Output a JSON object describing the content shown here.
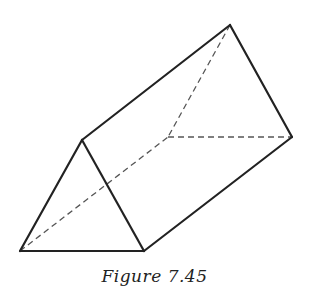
{
  "figure": {
    "caption": "Figure 7.45",
    "colors": {
      "edge": "#222222",
      "hidden_edge": "#555555",
      "background": "#ffffff"
    },
    "vertices": {
      "front_apex": [
        82,
        140
      ],
      "front_bottom_left": [
        20,
        251
      ],
      "front_bottom_right": [
        144,
        251
      ],
      "back_apex": [
        230,
        25
      ],
      "back_bottom_left_hidden": [
        168,
        137
      ],
      "back_bottom_right": [
        292,
        137
      ]
    },
    "visible_edges": [
      [
        "front_apex",
        "front_bottom_left"
      ],
      [
        "front_apex",
        "front_bottom_right"
      ],
      [
        "front_bottom_left",
        "front_bottom_right"
      ],
      [
        "front_apex",
        "back_apex"
      ],
      [
        "back_apex",
        "back_bottom_right"
      ],
      [
        "front_bottom_right",
        "back_bottom_right"
      ]
    ],
    "hidden_edges": [
      [
        "front_bottom_left",
        "back_bottom_left_hidden"
      ],
      [
        "back_apex",
        "back_bottom_left_hidden"
      ],
      [
        "back_bottom_left_hidden",
        "back_bottom_right"
      ]
    ]
  }
}
